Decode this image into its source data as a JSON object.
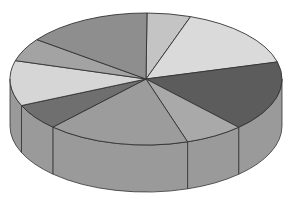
{
  "chart_data": {
    "type": "pie",
    "style": "3d",
    "title": "",
    "legend": [],
    "labels_visible": false,
    "center": [
      146,
      79
    ],
    "rx": 136,
    "ry": 66,
    "depth": 47,
    "slices": [
      {
        "name": "slice-1",
        "boundary_point": [
          147,
          13
        ],
        "color": "#c4c4c4"
      },
      {
        "name": "slice-2",
        "boundary_point": [
          191,
          16
        ],
        "color": "#dadada"
      },
      {
        "name": "slice-3",
        "boundary_point": [
          277,
          62
        ],
        "color": "#5c5c5c"
      },
      {
        "name": "slice-4",
        "boundary_point": [
          240,
          128
        ],
        "color": "#a9a9a9"
      },
      {
        "name": "slice-5",
        "boundary_point": [
          189,
          144
        ],
        "color": "#9c9c9c"
      },
      {
        "name": "slice-6",
        "boundary_point": [
          53,
          127
        ],
        "color": "#6f6f6f"
      },
      {
        "name": "slice-7",
        "boundary_point": [
          24,
          105
        ],
        "color": "#d6d6d6"
      },
      {
        "name": "slice-8",
        "boundary_point": [
          18,
          61
        ],
        "color": "#a3a3a3"
      },
      {
        "name": "slice-9",
        "boundary_point": [
          38,
          40
        ],
        "color": "#8e8e8e"
      }
    ],
    "approx_percentages": [
      5,
      15,
      18,
      8,
      17,
      7,
      10,
      5,
      15
    ],
    "side_color": "#9a9a9a",
    "outline_color": "#333333"
  }
}
